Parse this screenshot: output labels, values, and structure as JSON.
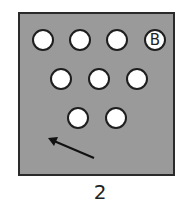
{
  "figure": {
    "caption": "2",
    "panel_color": "#9a9a9a",
    "balls": [
      {
        "row": 1,
        "cx": 43,
        "cy": 40,
        "label": ""
      },
      {
        "row": 1,
        "cx": 80,
        "cy": 40,
        "label": ""
      },
      {
        "row": 1,
        "cx": 117,
        "cy": 40,
        "label": ""
      },
      {
        "row": 1,
        "cx": 155,
        "cy": 40,
        "label": "B"
      },
      {
        "row": 2,
        "cx": 61,
        "cy": 79,
        "label": ""
      },
      {
        "row": 2,
        "cx": 99,
        "cy": 79,
        "label": ""
      },
      {
        "row": 2,
        "cx": 137,
        "cy": 79,
        "label": ""
      },
      {
        "row": 3,
        "cx": 78,
        "cy": 118,
        "label": ""
      },
      {
        "row": 3,
        "cx": 116,
        "cy": 118,
        "label": ""
      }
    ],
    "arrow": {
      "from": [
        94,
        158
      ],
      "to": [
        48,
        138
      ],
      "direction": "up-left"
    }
  }
}
